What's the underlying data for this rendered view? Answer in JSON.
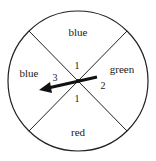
{
  "spinner": {
    "sections": [
      {
        "id": "top",
        "color_label": "blue"
      },
      {
        "id": "right",
        "color_label": "green"
      },
      {
        "id": "bottom",
        "color_label": "red"
      },
      {
        "id": "left",
        "color_label": "blue"
      }
    ],
    "angle_labels": {
      "top": "1",
      "right": "2",
      "bottom": "1",
      "left": "3"
    },
    "arrow_direction": "left"
  }
}
